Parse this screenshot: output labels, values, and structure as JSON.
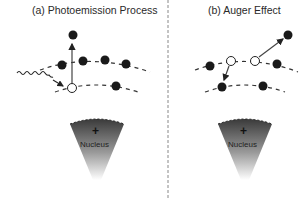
{
  "panels": [
    {
      "id": "a",
      "title": "(a) Photoemission Process",
      "nucleus_label": "Nucleus",
      "nucleus_symbol": "+"
    },
    {
      "id": "b",
      "title": "(b) Auger Effect",
      "nucleus_label": "Nucleus",
      "nucleus_symbol": "+"
    }
  ],
  "colors": {
    "electron": "#1a1a1a",
    "vacancy": "#ffffff",
    "line": "#333333",
    "divider": "#888888"
  }
}
